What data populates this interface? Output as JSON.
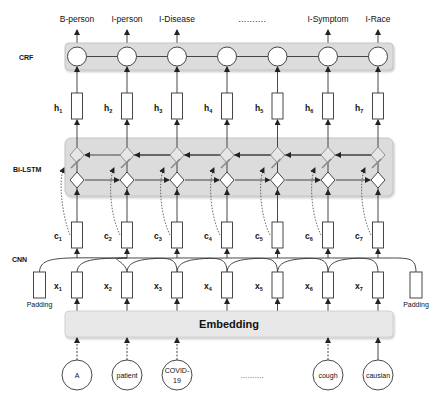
{
  "diagram": {
    "type": "BiLSTM-CNN-CRF NER architecture",
    "layers": {
      "crf": "CRF",
      "bilstm": "Bi-LSTM",
      "cnn": "CNN",
      "embedding": "Embedding"
    },
    "outputs": [
      "B-person",
      "I-person",
      "I-Disease",
      "……….",
      "I-Symptom",
      "I-Race"
    ],
    "hidden": [
      {
        "base": "h",
        "sub": "1"
      },
      {
        "base": "h",
        "sub": "2"
      },
      {
        "base": "h",
        "sub": "3"
      },
      {
        "base": "h",
        "sub": "4"
      },
      {
        "base": "h",
        "sub": "5"
      },
      {
        "base": "h",
        "sub": "6"
      },
      {
        "base": "h",
        "sub": "7"
      }
    ],
    "char_features": [
      {
        "base": "c",
        "sub": "1"
      },
      {
        "base": "c",
        "sub": "2"
      },
      {
        "base": "c",
        "sub": "3"
      },
      {
        "base": "c",
        "sub": "4"
      },
      {
        "base": "c",
        "sub": "5"
      },
      {
        "base": "c",
        "sub": "6"
      },
      {
        "base": "c",
        "sub": "7"
      }
    ],
    "inputs": [
      {
        "base": "x",
        "sub": "1"
      },
      {
        "base": "x",
        "sub": "2"
      },
      {
        "base": "x",
        "sub": "3"
      },
      {
        "base": "x",
        "sub": "4"
      },
      {
        "base": "x",
        "sub": "5"
      },
      {
        "base": "x",
        "sub": "6"
      },
      {
        "base": "x",
        "sub": "7"
      }
    ],
    "padding": {
      "left": "Padding",
      "right": "Padding"
    },
    "tokens": [
      "A",
      "patient",
      "COVID-",
      "19",
      "……….",
      "cough",
      "causian"
    ],
    "colors": {
      "layer_box_fill": "#dcdcdc",
      "embedding_fill": "#e8e8e8",
      "stroke": "#333333",
      "node_fill": "#ffffff",
      "diamond_back_fill": "#e6e6e6"
    }
  }
}
